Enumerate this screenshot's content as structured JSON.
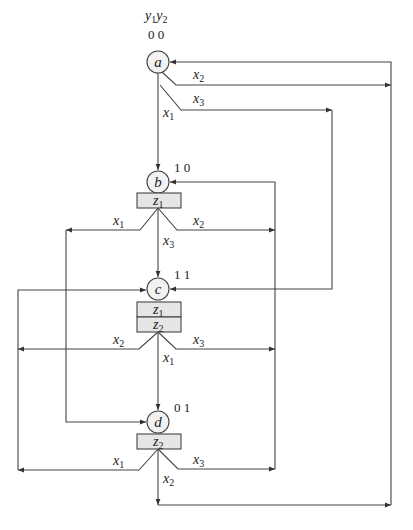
{
  "diagram": {
    "type": "algorithmic state machine (Moore) graph",
    "state_variables_header": {
      "y1": "y",
      "y1_sub": "1",
      "y2": "y",
      "y2_sub": "2"
    },
    "nodes": [
      {
        "id": "a",
        "label": "a",
        "code": "0 0",
        "outputs": []
      },
      {
        "id": "b",
        "label": "b",
        "code": "1 0",
        "outputs": [
          {
            "base": "z",
            "sub": "1"
          }
        ]
      },
      {
        "id": "c",
        "label": "c",
        "code": "1 1",
        "outputs": [
          {
            "base": "z",
            "sub": "1"
          },
          {
            "base": "z",
            "sub": "2"
          }
        ]
      },
      {
        "id": "d",
        "label": "d",
        "code": "0 1",
        "outputs": [
          {
            "base": "z",
            "sub": "2"
          }
        ]
      }
    ],
    "transitions": [
      {
        "from": "a",
        "to": "b",
        "condition": {
          "base": "x",
          "sub": "1"
        }
      },
      {
        "from": "a",
        "to": "d",
        "condition": {
          "base": "x",
          "sub": "2"
        }
      },
      {
        "from": "a",
        "to": "c",
        "condition": {
          "base": "x",
          "sub": "3"
        }
      },
      {
        "from": "b",
        "to": "d",
        "condition": {
          "base": "x",
          "sub": "1"
        }
      },
      {
        "from": "b",
        "to": "b",
        "condition": {
          "base": "x",
          "sub": "2"
        }
      },
      {
        "from": "b",
        "to": "c",
        "condition": {
          "base": "x",
          "sub": "3"
        }
      },
      {
        "from": "c",
        "to": "d",
        "condition": {
          "base": "x",
          "sub": "1"
        }
      },
      {
        "from": "c",
        "to": "c",
        "condition": {
          "base": "x",
          "sub": "2"
        }
      },
      {
        "from": "c",
        "to": "b",
        "condition": {
          "base": "x",
          "sub": "3"
        }
      },
      {
        "from": "d",
        "to": "c",
        "condition": {
          "base": "x",
          "sub": "1"
        }
      },
      {
        "from": "d",
        "to": "a",
        "condition": {
          "base": "x",
          "sub": "2"
        }
      },
      {
        "from": "d",
        "to": "b",
        "condition": {
          "base": "x",
          "sub": "3"
        }
      }
    ],
    "colors": {
      "line": "#444444",
      "node_fill": "#f2f2f2",
      "box_fill": "#e6e6e6",
      "background": "#ffffff"
    }
  }
}
